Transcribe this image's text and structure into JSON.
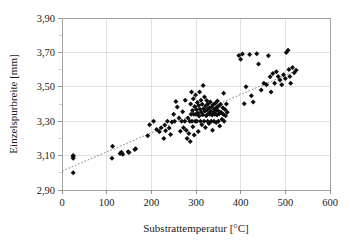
{
  "chart_data": {
    "type": "scatter",
    "title": "",
    "xlabel": "Substrattemperatur [°C]",
    "ylabel": "Einzelspurbreite [mm]",
    "xlim": [
      0,
      600
    ],
    "ylim": [
      2.9,
      3.9
    ],
    "xticks": [
      0,
      100,
      200,
      300,
      400,
      500,
      600
    ],
    "xtick_labels": [
      "0",
      "100",
      "200",
      "300",
      "400",
      "500",
      "600"
    ],
    "yticks": [
      2.9,
      3.1,
      3.3,
      3.5,
      3.7,
      3.9
    ],
    "ytick_labels": [
      "2,90",
      "3,10",
      "3,30",
      "3,50",
      "3,70",
      "3,90"
    ],
    "y_minor_ticks": [
      3.0,
      3.2,
      3.4,
      3.6,
      3.8
    ],
    "grid": "both",
    "legend": "none",
    "decimal_separator": ",",
    "marker": "diamond",
    "marker_color": "#0d0d0d",
    "series": [
      {
        "name": "Einzelspurbreite",
        "points": [
          [
            25,
            3.095
          ],
          [
            25,
            3.085
          ],
          [
            25,
            3.1
          ],
          [
            25,
            3.0
          ],
          [
            112,
            3.085
          ],
          [
            113,
            3.155
          ],
          [
            130,
            3.112
          ],
          [
            133,
            3.12
          ],
          [
            136,
            3.108
          ],
          [
            148,
            3.122
          ],
          [
            150,
            3.118
          ],
          [
            163,
            3.135
          ],
          [
            165,
            3.14
          ],
          [
            192,
            3.215
          ],
          [
            196,
            3.28
          ],
          [
            205,
            3.3
          ],
          [
            212,
            3.252
          ],
          [
            218,
            3.238
          ],
          [
            222,
            3.262
          ],
          [
            228,
            3.2
          ],
          [
            230,
            3.278
          ],
          [
            232,
            3.245
          ],
          [
            236,
            3.3
          ],
          [
            240,
            3.26
          ],
          [
            243,
            3.222
          ],
          [
            246,
            3.296
          ],
          [
            250,
            3.34
          ],
          [
            252,
            3.3
          ],
          [
            255,
            3.415
          ],
          [
            258,
            3.382
          ],
          [
            262,
            3.318
          ],
          [
            265,
            3.242
          ],
          [
            268,
            3.3
          ],
          [
            270,
            3.355
          ],
          [
            272,
            3.262
          ],
          [
            275,
            3.3
          ],
          [
            276,
            3.422
          ],
          [
            278,
            3.248
          ],
          [
            280,
            3.2
          ],
          [
            282,
            3.318
          ],
          [
            284,
            3.228
          ],
          [
            286,
            3.3
          ],
          [
            287,
            3.182
          ],
          [
            288,
            3.4
          ],
          [
            289,
            3.34
          ],
          [
            290,
            3.47
          ],
          [
            291,
            3.3
          ],
          [
            292,
            3.362
          ],
          [
            293,
            3.268
          ],
          [
            294,
            3.43
          ],
          [
            295,
            3.34
          ],
          [
            296,
            3.22
          ],
          [
            297,
            3.386
          ],
          [
            298,
            3.3
          ],
          [
            299,
            3.452
          ],
          [
            300,
            3.34
          ],
          [
            301,
            3.368
          ],
          [
            302,
            3.3
          ],
          [
            303,
            3.408
          ],
          [
            304,
            3.348
          ],
          [
            305,
            3.24
          ],
          [
            306,
            3.392
          ],
          [
            307,
            3.33
          ],
          [
            308,
            3.47
          ],
          [
            309,
            3.37
          ],
          [
            310,
            3.3
          ],
          [
            311,
            3.422
          ],
          [
            312,
            3.352
          ],
          [
            313,
            3.28
          ],
          [
            314,
            3.398
          ],
          [
            315,
            3.338
          ],
          [
            316,
            3.508
          ],
          [
            317,
            3.372
          ],
          [
            318,
            3.3
          ],
          [
            319,
            3.44
          ],
          [
            320,
            3.358
          ],
          [
            321,
            3.264
          ],
          [
            322,
            3.388
          ],
          [
            323,
            3.332
          ],
          [
            324,
            3.42
          ],
          [
            325,
            3.366
          ],
          [
            326,
            3.3
          ],
          [
            327,
            3.402
          ],
          [
            328,
            3.345
          ],
          [
            329,
            3.286
          ],
          [
            330,
            3.378
          ],
          [
            331,
            3.34
          ],
          [
            332,
            3.412
          ],
          [
            333,
            3.358
          ],
          [
            334,
            3.3
          ],
          [
            335,
            3.382
          ],
          [
            336,
            3.336
          ],
          [
            337,
            3.248
          ],
          [
            338,
            3.396
          ],
          [
            339,
            3.352
          ],
          [
            340,
            3.3
          ],
          [
            341,
            3.37
          ],
          [
            342,
            3.34
          ],
          [
            343,
            3.405
          ],
          [
            344,
            3.358
          ],
          [
            345,
            3.292
          ],
          [
            346,
            3.38
          ],
          [
            347,
            3.336
          ],
          [
            348,
            3.418
          ],
          [
            349,
            3.362
          ],
          [
            350,
            3.3
          ],
          [
            351,
            3.388
          ],
          [
            352,
            3.344
          ],
          [
            353,
            3.272
          ],
          [
            355,
            3.398
          ],
          [
            356,
            3.352
          ],
          [
            358,
            3.312
          ],
          [
            360,
            3.378
          ],
          [
            361,
            3.34
          ],
          [
            362,
            3.462
          ],
          [
            363,
            3.3
          ],
          [
            365,
            3.368
          ],
          [
            366,
            3.332
          ],
          [
            368,
            3.4
          ],
          [
            370,
            3.352
          ],
          [
            396,
            3.682
          ],
          [
            400,
            3.66
          ],
          [
            404,
            3.69
          ],
          [
            408,
            3.402
          ],
          [
            412,
            3.5
          ],
          [
            420,
            3.688
          ],
          [
            424,
            3.448
          ],
          [
            428,
            3.412
          ],
          [
            436,
            3.692
          ],
          [
            440,
            3.632
          ],
          [
            446,
            3.482
          ],
          [
            452,
            3.52
          ],
          [
            458,
            3.512
          ],
          [
            462,
            3.68
          ],
          [
            466,
            3.558
          ],
          [
            468,
            3.47
          ],
          [
            472,
            3.578
          ],
          [
            476,
            3.52
          ],
          [
            480,
            3.588
          ],
          [
            484,
            3.56
          ],
          [
            488,
            3.54
          ],
          [
            492,
            3.512
          ],
          [
            496,
            3.57
          ],
          [
            500,
            3.548
          ],
          [
            502,
            3.7
          ],
          [
            506,
            3.712
          ],
          [
            508,
            3.6
          ],
          [
            510,
            3.56
          ],
          [
            512,
            3.52
          ],
          [
            516,
            3.612
          ],
          [
            520,
            3.582
          ],
          [
            524,
            3.596
          ]
        ]
      }
    ],
    "trendline": {
      "style": "dotted",
      "color": "#7d7d7d",
      "x_start": 0,
      "y_start": 3.01,
      "x_end": 530,
      "y_end": 3.6
    }
  },
  "plot_area": {
    "left": 62,
    "top": 18,
    "right": 330,
    "bottom": 190
  }
}
